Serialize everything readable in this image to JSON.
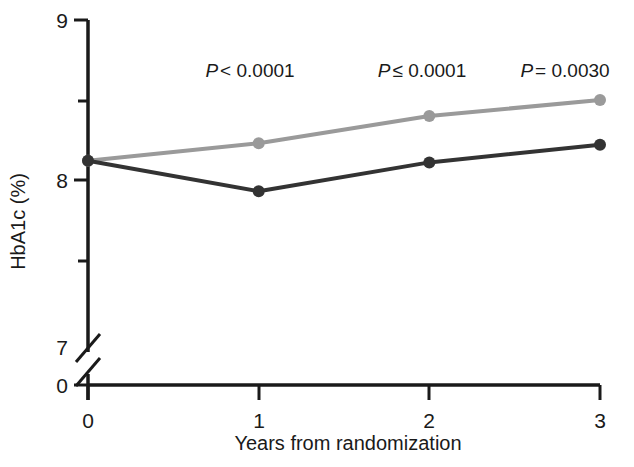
{
  "chart_data": {
    "type": "line",
    "title": "",
    "xlabel": "Years from randomization",
    "ylabel": "HbA1c (%)",
    "x": [
      0,
      1,
      2,
      3
    ],
    "xticklabels": [
      "0",
      "1",
      "2",
      "3"
    ],
    "xlim": [
      0,
      3
    ],
    "yticklabels": [
      "9",
      "8",
      "7",
      "0"
    ],
    "ytickvalues": [
      9,
      8,
      7,
      0
    ],
    "yminorticks": [
      8.5,
      7.5
    ],
    "ylim": [
      7,
      9
    ],
    "axis_break": true,
    "grid": false,
    "legend": "none",
    "series": [
      {
        "name": "standard-therapy",
        "color": "#9a9a9a",
        "values": [
          8.12,
          8.23,
          8.4,
          8.5
        ]
      },
      {
        "name": "intensive-therapy",
        "color": "#333333",
        "values": [
          8.12,
          7.93,
          8.11,
          8.22
        ]
      }
    ],
    "annotations": [
      {
        "x": 1,
        "operator": "<",
        "value": "0.0001",
        "text": "P < 0.0001"
      },
      {
        "x": 2,
        "operator": "≤",
        "value": "0.0001",
        "text": "P ≤ 0.0001"
      },
      {
        "x": 3,
        "operator": "=",
        "value": "0.0030",
        "text": "P = 0.0030"
      }
    ],
    "annotation_label_prefix": "P"
  }
}
